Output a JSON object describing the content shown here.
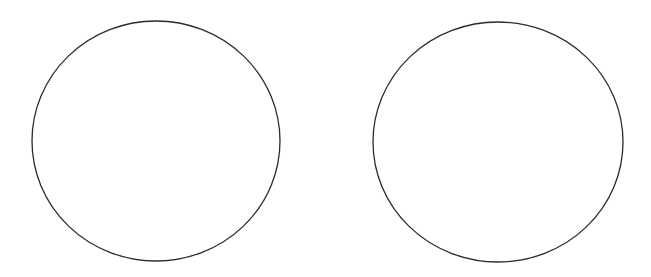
{
  "canvas": {
    "width": 651,
    "height": 277,
    "background": "#ffffff"
  },
  "shapes": [
    {
      "type": "ellipse",
      "cx": 156,
      "cy": 141,
      "rx": 124,
      "ry": 120,
      "stroke": "#2b2b2b",
      "fill": "none",
      "stroke_width": 1.3
    },
    {
      "type": "ellipse",
      "cx": 498,
      "cy": 142,
      "rx": 125,
      "ry": 120,
      "stroke": "#2b2b2b",
      "fill": "none",
      "stroke_width": 1.3
    }
  ]
}
